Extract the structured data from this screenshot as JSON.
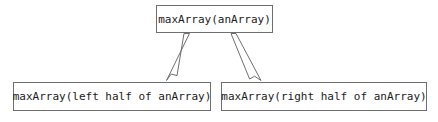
{
  "diagram": {
    "background_color": "#ffffff",
    "border_color": "#6f6f6f",
    "text_color": "#1a1a1a",
    "nodes": [
      {
        "id": "root",
        "label": "maxArray(anArray)"
      },
      {
        "id": "left",
        "label": "maxArray(left half of anArray)"
      },
      {
        "id": "right",
        "label": "maxArray(right half of anArray)"
      }
    ],
    "edges": [
      {
        "from": "root",
        "to": "left",
        "style": "hollow-arrow"
      },
      {
        "from": "root",
        "to": "right",
        "style": "hollow-arrow"
      }
    ]
  }
}
